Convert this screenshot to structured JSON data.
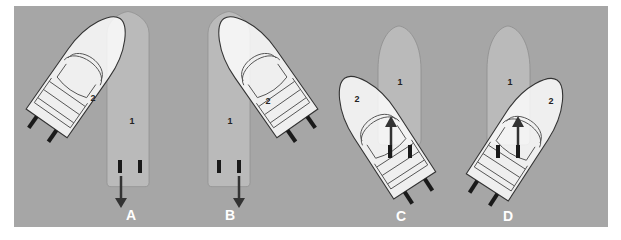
{
  "figure": {
    "background_color": "#a6a6a6",
    "boat1_color": "#b9b9b9",
    "boat2_color": "#ffffff",
    "arrow_color": "#333333",
    "label_color": "#ffffff",
    "panels": [
      {
        "id": "A",
        "label": "A",
        "boat1_label": "1",
        "boat2_label": "2",
        "arrow": "down"
      },
      {
        "id": "B",
        "label": "B",
        "boat1_label": "1",
        "boat2_label": "2",
        "arrow": "down"
      },
      {
        "id": "C",
        "label": "C",
        "boat1_label": "1",
        "boat2_label": "2",
        "arrow": "up"
      },
      {
        "id": "D",
        "label": "D",
        "boat1_label": "1",
        "boat2_label": "2",
        "arrow": "up"
      }
    ]
  }
}
